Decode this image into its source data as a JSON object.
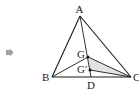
{
  "figure": {
    "type": "geometry-triangle",
    "bullet_icon": "gray-arrow-bullet",
    "colors": {
      "stroke": "#1a1a1a",
      "shade": "#e2e2e2",
      "bullet": "#9a9a9a"
    },
    "points": {
      "A": {
        "label": "A",
        "x": 80,
        "y": 16
      },
      "B": {
        "label": "B",
        "x": 52,
        "y": 77
      },
      "C": {
        "label": "C",
        "x": 131,
        "y": 77
      },
      "G": {
        "label": "G",
        "x": 88,
        "y": 57
      },
      "Gp": {
        "label": "G′",
        "x": 90,
        "y": 70
      },
      "D": {
        "label": "D",
        "x": 91,
        "y": 77
      }
    },
    "segments": [
      "AB",
      "AC",
      "BC",
      "AD",
      "BG",
      "GC",
      "G'C"
    ],
    "shaded_region": "triangle GG'C"
  }
}
